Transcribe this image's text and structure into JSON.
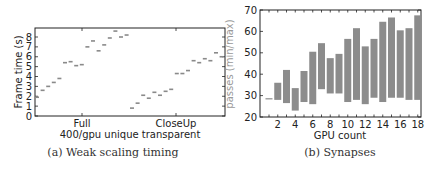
{
  "chart_data": [
    {
      "type": "scatter",
      "title": "",
      "caption": "(a) Weak scaling timing",
      "xlabel": "400/gpu unique transparent",
      "ylabel": "Frame time (s)",
      "ylim": [
        0,
        9
      ],
      "yticks": [
        "0",
        "1",
        "2",
        "3",
        "4",
        "5",
        "6",
        "7",
        "8"
      ],
      "categories": [
        "Full",
        "CloseUp"
      ],
      "grid": false,
      "marker": "short horizontal dash",
      "marker_color": "#8a8a8a",
      "series": [
        {
          "name": "Full",
          "values": [
            1.9,
            2.6,
            3.0,
            3.4,
            3.8,
            5.4,
            5.5,
            5.1,
            5.2,
            7.0,
            7.6,
            6.6,
            7.2,
            7.9,
            8.6,
            8.0,
            8.2
          ]
        },
        {
          "name": "CloseUp",
          "values": [
            0.8,
            1.3,
            2.1,
            1.8,
            2.4,
            2.1,
            2.5,
            2.7,
            4.3,
            4.3,
            4.6,
            5.6,
            5.4,
            5.8,
            5.6,
            6.4,
            6.0
          ]
        }
      ]
    },
    {
      "type": "bar",
      "title": "",
      "caption": "(b) Synapses",
      "xlabel": "GPU count",
      "ylabel": "passes (min/max)",
      "ylim": [
        20,
        70
      ],
      "yticks": [
        "20",
        "30",
        "40",
        "50",
        "60",
        "70"
      ],
      "xticks": [
        "2",
        "4",
        "6",
        "8",
        "10",
        "12",
        "14",
        "16",
        "18"
      ],
      "grid": false,
      "bar_color": "#8c8c8c",
      "x": [
        1,
        2,
        3,
        4,
        5,
        6,
        7,
        8,
        9,
        10,
        11,
        12,
        13,
        14,
        15,
        16,
        17,
        18
      ],
      "series": [
        {
          "name": "min",
          "values": [
            28.5,
            28,
            26.5,
            23,
            27,
            26,
            33,
            31,
            31,
            27,
            28,
            26,
            29,
            27,
            29,
            29,
            28,
            28
          ]
        },
        {
          "name": "max",
          "values": [
            28.5,
            36,
            42,
            33.5,
            41.5,
            50.5,
            54.5,
            47.5,
            49.5,
            56.5,
            61.5,
            53,
            56.5,
            64.5,
            66.5,
            60.5,
            61.5,
            67.5
          ]
        }
      ]
    }
  ]
}
